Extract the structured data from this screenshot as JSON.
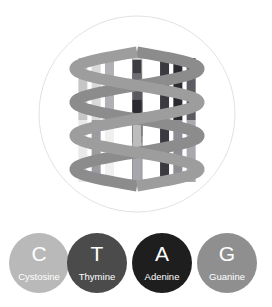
{
  "figure": {
    "background_color": "#ffffff",
    "medallion": {
      "name": "circular-frame",
      "center_x": 137,
      "center_y": 114,
      "radius": 98,
      "stroke_color": "#e2e2e4",
      "fill_color": "#ffffff"
    },
    "helix": {
      "backbone_color": "#9d9d9d",
      "backbone_color_dark": "#8c8c8c",
      "backbone_width": 11,
      "turns": 2,
      "amplitude": 62,
      "top_y": 52,
      "bottom_y": 186,
      "left_x": 42,
      "right_x": 232,
      "rung_colors_top": [
        "#33333a",
        "#b4b4b4",
        "#cfcfcf",
        "#a9a9a9",
        "#d7d7d7",
        "#3d3d42",
        "#6d6d72",
        "#59595e",
        "#2b2b30",
        "#bdbdbd"
      ],
      "rung_colors_bottom": [
        "#7e7e84",
        "#e6e6e6",
        "#8e8e93",
        "#efefef",
        "#9c9ca1",
        "#2f2f34",
        "#5d5d62",
        "#93939a",
        "#9a9aa0",
        "#a6a6ac"
      ]
    }
  },
  "legend": {
    "name": "nucleotide-legend",
    "items": [
      {
        "letter": "C",
        "label": "Cystosine",
        "color": "#b9b9b9",
        "text_color": "#ffffff"
      },
      {
        "letter": "T",
        "label": "Thymine",
        "color": "#4b4b4b",
        "text_color": "#ffffff"
      },
      {
        "letter": "A",
        "label": "Adenine",
        "color": "#1e1e1e",
        "text_color": "#ffffff"
      },
      {
        "letter": "G",
        "label": "Guanine",
        "color": "#8f8f8f",
        "text_color": "#ffffff"
      }
    ]
  }
}
